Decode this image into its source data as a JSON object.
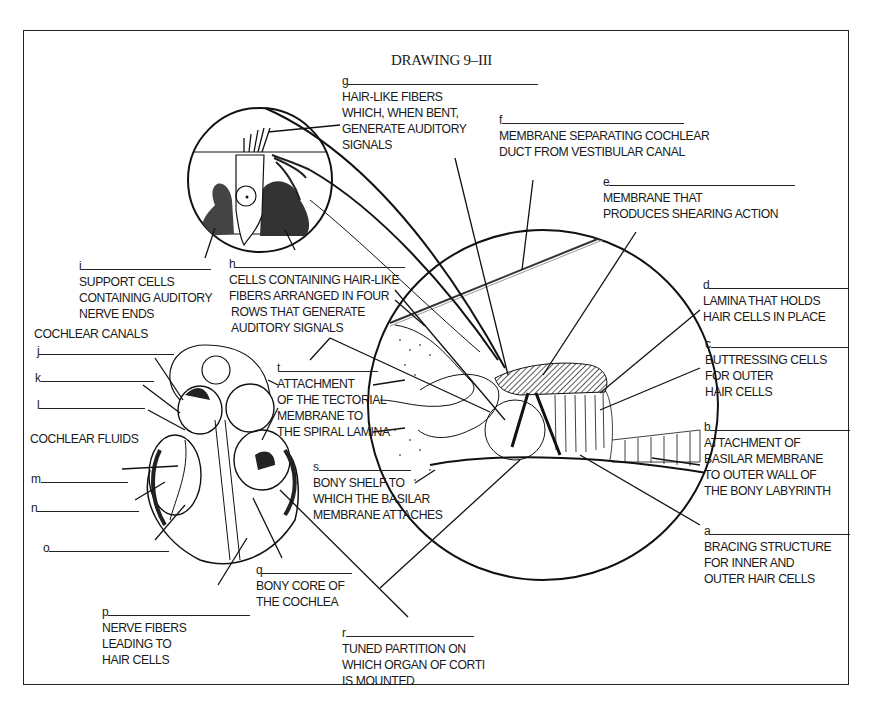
{
  "title": "DRAWING 9–III",
  "headings": {
    "cochlear_canals": "COCHLEAR CANALS",
    "cochlear_fluids": "COCHLEAR FLUIDS"
  },
  "labels": {
    "a": {
      "letter": "a",
      "lines": [
        "BRACING STRUCTURE",
        "FOR INNER AND",
        "OUTER HAIR CELLS"
      ]
    },
    "b": {
      "letter": "b",
      "lines": [
        "ATTACHMENT OF",
        "BASILAR MEMBRANE",
        "TO OUTER WALL OF",
        "THE BONY LABYRINTH"
      ]
    },
    "c": {
      "letter": "c",
      "lines": [
        "BUTTRESSING CELLS",
        "FOR OUTER",
        "HAIR CELLS"
      ]
    },
    "d": {
      "letter": "d",
      "lines": [
        "LAMINA THAT HOLDS",
        "HAIR CELLS IN PLACE"
      ]
    },
    "e": {
      "letter": "e",
      "lines": [
        "MEMBRANE THAT",
        "PRODUCES SHEARING ACTION"
      ]
    },
    "f": {
      "letter": "f",
      "lines": [
        "MEMBRANE SEPARATING COCHLEAR",
        "DUCT FROM VESTIBULAR CANAL"
      ]
    },
    "g": {
      "letter": "g",
      "lines": [
        "HAIR-LIKE FIBERS",
        "WHICH, WHEN BENT,",
        "GENERATE AUDITORY",
        "SIGNALS"
      ]
    },
    "h": {
      "letter": "h",
      "lines": [
        "CELLS CONTAINING  HAIR-LIKE",
        "FIBERS ARRANGED IN FOUR",
        "ROWS THAT GENERATE",
        "AUDITORY SIGNALS"
      ]
    },
    "i": {
      "letter": "i",
      "lines": [
        "SUPPORT CELLS",
        "CONTAINING AUDITORY",
        "NERVE ENDS"
      ]
    },
    "j": {
      "letter": "j",
      "lines": []
    },
    "k": {
      "letter": "k",
      "lines": []
    },
    "l": {
      "letter": "l",
      "lines": []
    },
    "m": {
      "letter": "m",
      "lines": []
    },
    "n": {
      "letter": "n",
      "lines": []
    },
    "o": {
      "letter": "o",
      "lines": []
    },
    "p": {
      "letter": "p",
      "lines": [
        "NERVE FIBERS",
        "LEADING TO",
        "HAIR CELLS"
      ]
    },
    "q": {
      "letter": "q",
      "lines": [
        "BONY CORE OF",
        "THE COCHLEA"
      ]
    },
    "r": {
      "letter": "r",
      "lines": [
        "TUNED PARTITION ON",
        "WHICH ORGAN OF CORTI",
        "IS MOUNTED"
      ]
    },
    "s": {
      "letter": "s",
      "lines": [
        "BONY SHELF TO",
        "WHICH THE BASILAR",
        "MEMBRANE ATTACHES"
      ]
    },
    "t": {
      "letter": "t",
      "lines": [
        "ATTACHMENT",
        "OF THE TECTORIAL",
        "MEMBRANE TO",
        "THE SPIRAL LAMINA"
      ]
    }
  },
  "figures": {
    "hair_cell_inset": "hair-cell-magnified-circle",
    "organ_of_corti": "organ-of-corti-cross-section-circle",
    "cochlea": "cochlea-cross-section"
  },
  "colors": {
    "ink": "#1a1a1a",
    "shading": "#555555",
    "paper": "#ffffff"
  }
}
